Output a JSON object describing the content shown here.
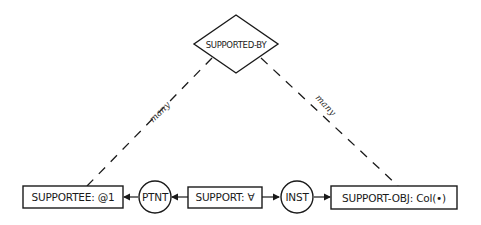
{
  "diagram": {
    "type": "conceptual-graph",
    "relation": {
      "label": "SUPPORTED-BY",
      "shape": "diamond"
    },
    "concepts": [
      {
        "id": "supportee",
        "label": "SUPPORTEE: @1",
        "shape": "box"
      },
      {
        "id": "support",
        "label": "SUPPORT: ∀",
        "shape": "box"
      },
      {
        "id": "support-obj",
        "label": "SUPPORT-OBJ: Col(•)",
        "shape": "box"
      }
    ],
    "relations": [
      {
        "id": "ptnt",
        "label": "PTNT",
        "shape": "circle"
      },
      {
        "id": "inst",
        "label": "INST",
        "shape": "circle"
      }
    ],
    "links": [
      {
        "from": "supported-by",
        "to": "supportee",
        "style": "dashed",
        "label": "many"
      },
      {
        "from": "supported-by",
        "to": "support-obj",
        "style": "dashed",
        "label": "many"
      },
      {
        "from": "support",
        "to": "ptnt",
        "style": "arrow"
      },
      {
        "from": "ptnt",
        "to": "supportee",
        "style": "arrow"
      },
      {
        "from": "support",
        "to": "inst",
        "style": "arrow"
      },
      {
        "from": "inst",
        "to": "support-obj",
        "style": "arrow"
      }
    ],
    "colors": {
      "stroke": "#1a1a1a",
      "background": "#ffffff"
    }
  }
}
